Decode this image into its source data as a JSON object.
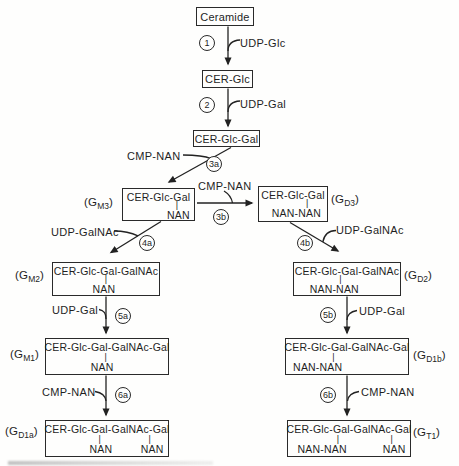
{
  "figure": {
    "colors": {
      "ink": "#1f1f1f",
      "paper": "#fefefd"
    },
    "boxes": {
      "ceramide": {
        "top": "Ceramide"
      },
      "cer_glc": {
        "top": "CER-Glc"
      },
      "cer_glc_gal": {
        "top": "CER-Glc-Gal"
      },
      "gm3": {
        "top": "CER-Glc-Gal",
        "bond": "|",
        "bottom": "NAN"
      },
      "gd3": {
        "top": "CER-Glc-Gal",
        "bond": "|",
        "bottom": "NAN-NAN"
      },
      "gm2": {
        "top": "CER-Glc-Gal-GalNAc",
        "bond": "|",
        "bottom": "NAN"
      },
      "gd2": {
        "top": "CER-Glc-Gal-GalNAc",
        "bond": "|",
        "bottom": "NAN-NAN"
      },
      "gm1": {
        "top": "CER-Glc-Gal-GalNAc-Gal",
        "bond": "|",
        "bottom": "NAN"
      },
      "gd1b": {
        "top": "CER-Glc-Gal-GalNAc-Gal",
        "bond": "|",
        "bottom": "NAN-NAN"
      },
      "gd1a": {
        "top": "CER-Glc-Gal-GalNAc-Gal",
        "bond1": "|",
        "bond2": "|",
        "bottom1": "NAN",
        "bottom2": "NAN"
      },
      "gt1": {
        "top": "CER-Glc-Gal-GalNAc-Gal",
        "bond1": "|",
        "bond2": "|",
        "bottom1": "NAN-NAN",
        "bottom2": "NAN"
      }
    },
    "ganglioside_labels": {
      "gm3": {
        "pre": "(G",
        "sub": "M3",
        "post": ")"
      },
      "gd3": {
        "pre": "(G",
        "sub": "D3",
        "post": ")"
      },
      "gm2": {
        "pre": "(G",
        "sub": "M2",
        "post": ")"
      },
      "gd2": {
        "pre": "(G",
        "sub": "D2",
        "post": ")"
      },
      "gm1": {
        "pre": "(G",
        "sub": "M1",
        "post": ")"
      },
      "gd1b": {
        "pre": "(G",
        "sub": "D1b",
        "post": ")"
      },
      "gd1a": {
        "pre": "(G",
        "sub": "D1a",
        "post": ")"
      },
      "gt1": {
        "pre": "(G",
        "sub": "T1",
        "post": ")"
      }
    },
    "reagents": {
      "r1": "UDP-Glc",
      "r2": "UDP-Gal",
      "r3a": "CMP-NAN",
      "r3b": "CMP-NAN",
      "r4a": "UDP-GalNAc",
      "r4b": "UDP-GalNAc",
      "r5a": "UDP-Gal",
      "r5b": "UDP-Gal",
      "r6a": "CMP-NAN",
      "r6b": "CMP-NAN"
    },
    "steps": {
      "s1": "1",
      "s2": "2",
      "s3a": "3a",
      "s3b": "3b",
      "s4a": "4a",
      "s4b": "4b",
      "s5a": "5a",
      "s5b": "5b",
      "s6a": "6a",
      "s6b": "6b"
    }
  }
}
